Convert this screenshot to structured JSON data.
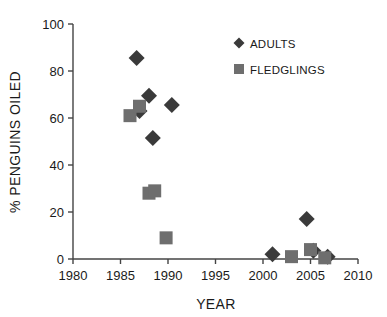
{
  "chart_data": {
    "type": "scatter",
    "title": "",
    "xlabel": "YEAR",
    "ylabel": "% PENGUINS OILED",
    "xlim": [
      1980,
      2010
    ],
    "ylim": [
      0,
      100
    ],
    "xticks": [
      1980,
      1985,
      1990,
      1995,
      2000,
      2005,
      2010
    ],
    "xtick_labels": [
      "1980",
      "1985",
      "1990",
      "1995",
      "2000",
      "2005",
      "2010"
    ],
    "yticks": [
      0,
      20,
      40,
      60,
      80,
      100
    ],
    "ytick_labels": [
      "0",
      "20",
      "40",
      "60",
      "80",
      "100"
    ],
    "grid": false,
    "legend_position": "top-right",
    "series": [
      {
        "name": "ADULTS",
        "marker": "diamond",
        "color": "#3a3a3a",
        "points": [
          {
            "x": 1986.7,
            "y": 85.5
          },
          {
            "x": 1987.0,
            "y": 63.0
          },
          {
            "x": 1988.0,
            "y": 69.5
          },
          {
            "x": 1988.4,
            "y": 51.5
          },
          {
            "x": 1990.4,
            "y": 65.5
          },
          {
            "x": 2001.0,
            "y": 2.0
          },
          {
            "x": 2004.6,
            "y": 17.0
          },
          {
            "x": 2005.3,
            "y": 3.5
          },
          {
            "x": 2006.8,
            "y": 1.0
          }
        ]
      },
      {
        "name": "FLEDGLINGS",
        "marker": "square",
        "color": "#6e6e6e",
        "points": [
          {
            "x": 1986.0,
            "y": 61.0
          },
          {
            "x": 1987.0,
            "y": 65.0
          },
          {
            "x": 1988.0,
            "y": 28.0
          },
          {
            "x": 1988.6,
            "y": 29.0
          },
          {
            "x": 1989.8,
            "y": 9.0
          },
          {
            "x": 2003.0,
            "y": 1.0
          },
          {
            "x": 2005.0,
            "y": 4.0
          },
          {
            "x": 2006.5,
            "y": 0.5
          }
        ]
      }
    ]
  },
  "legend": {
    "entries": [
      {
        "label": "ADULTS",
        "marker": "diamond",
        "color": "#3a3a3a"
      },
      {
        "label": "FLEDGLINGS",
        "marker": "square",
        "color": "#6e6e6e"
      }
    ]
  },
  "colors": {
    "adults": "#3a3a3a",
    "fledglings": "#6e6e6e",
    "axis": "#444444",
    "text": "#1a1a1a",
    "background": "#ffffff"
  }
}
